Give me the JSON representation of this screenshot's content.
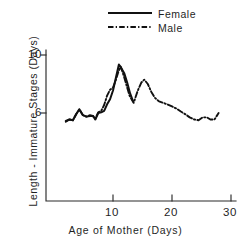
{
  "figure": {
    "background_color": "#ffffff",
    "line_color": "#111111",
    "axis_color": "#2b2b2b"
  },
  "axes": {
    "y_title": "Length - Immature Stages (Days)",
    "x_title": "Age of Mother (Days)",
    "y_ticks": [
      "6",
      "10"
    ],
    "x_ticks": [
      "10",
      "20",
      "30"
    ]
  },
  "legend": {
    "entries": [
      {
        "label": "Female",
        "style": "solid"
      },
      {
        "label": "Male",
        "style": "dash-dot"
      }
    ]
  },
  "chart_data": {
    "type": "line",
    "title": "",
    "subtitle": "",
    "xlabel": "Age of Mother (Days)",
    "ylabel": "Length - Immature Stages (Days)",
    "xlim": [
      0,
      31
    ],
    "ylim": [
      0,
      10.8
    ],
    "x_tick_values": [
      10,
      20,
      30
    ],
    "y_tick_values": [
      6,
      10
    ],
    "grid": false,
    "legend_position": "top-center",
    "annotations": [],
    "series": [
      {
        "name": "Female",
        "style": "solid",
        "color": "#111111",
        "points": [
          [
            2.0,
            5.45
          ],
          [
            2.6,
            5.55
          ],
          [
            3.2,
            5.5
          ],
          [
            3.8,
            5.95
          ],
          [
            4.3,
            6.25
          ],
          [
            4.9,
            5.85
          ],
          [
            5.5,
            5.75
          ],
          [
            6.1,
            5.8
          ],
          [
            6.6,
            5.8
          ],
          [
            7.0,
            5.55
          ],
          [
            7.5,
            6.0
          ],
          [
            8.0,
            6.05
          ],
          [
            8.5,
            6.15
          ],
          [
            9.0,
            6.6
          ],
          [
            9.5,
            6.95
          ],
          [
            10.0,
            7.55
          ],
          [
            10.5,
            8.45
          ],
          [
            11.0,
            9.35
          ],
          [
            11.4,
            9.1
          ],
          [
            11.9,
            8.75
          ],
          [
            12.4,
            8.1
          ],
          [
            12.9,
            7.35
          ],
          [
            13.4,
            6.8
          ]
        ]
      },
      {
        "name": "Male",
        "style": "dash-dot",
        "color": "#111111",
        "points": [
          [
            2.0,
            5.4
          ],
          [
            2.6,
            5.55
          ],
          [
            3.2,
            5.5
          ],
          [
            3.8,
            5.95
          ],
          [
            4.3,
            6.25
          ],
          [
            4.9,
            5.85
          ],
          [
            5.5,
            5.75
          ],
          [
            6.1,
            5.85
          ],
          [
            6.6,
            5.8
          ],
          [
            7.0,
            5.6
          ],
          [
            7.5,
            6.05
          ],
          [
            8.0,
            6.15
          ],
          [
            8.5,
            6.55
          ],
          [
            9.0,
            7.2
          ],
          [
            9.5,
            7.6
          ],
          [
            10.0,
            7.75
          ],
          [
            10.5,
            8.3
          ],
          [
            11.0,
            8.95
          ],
          [
            11.3,
            9.2
          ],
          [
            11.8,
            8.6
          ],
          [
            12.3,
            7.9
          ],
          [
            12.8,
            7.2
          ],
          [
            13.5,
            6.7
          ],
          [
            14.2,
            7.55
          ],
          [
            14.8,
            8.1
          ],
          [
            15.3,
            8.3
          ],
          [
            15.9,
            8.0
          ],
          [
            16.5,
            7.45
          ],
          [
            17.1,
            7.05
          ],
          [
            17.8,
            6.8
          ],
          [
            18.5,
            6.7
          ],
          [
            19.2,
            6.6
          ],
          [
            20.0,
            6.45
          ],
          [
            20.8,
            6.3
          ],
          [
            21.5,
            6.1
          ],
          [
            22.3,
            5.9
          ],
          [
            23.0,
            5.7
          ],
          [
            23.8,
            5.55
          ],
          [
            24.5,
            5.5
          ],
          [
            25.2,
            5.7
          ],
          [
            25.9,
            5.7
          ],
          [
            26.5,
            5.55
          ],
          [
            27.2,
            5.55
          ],
          [
            27.9,
            6.0
          ]
        ]
      }
    ]
  }
}
